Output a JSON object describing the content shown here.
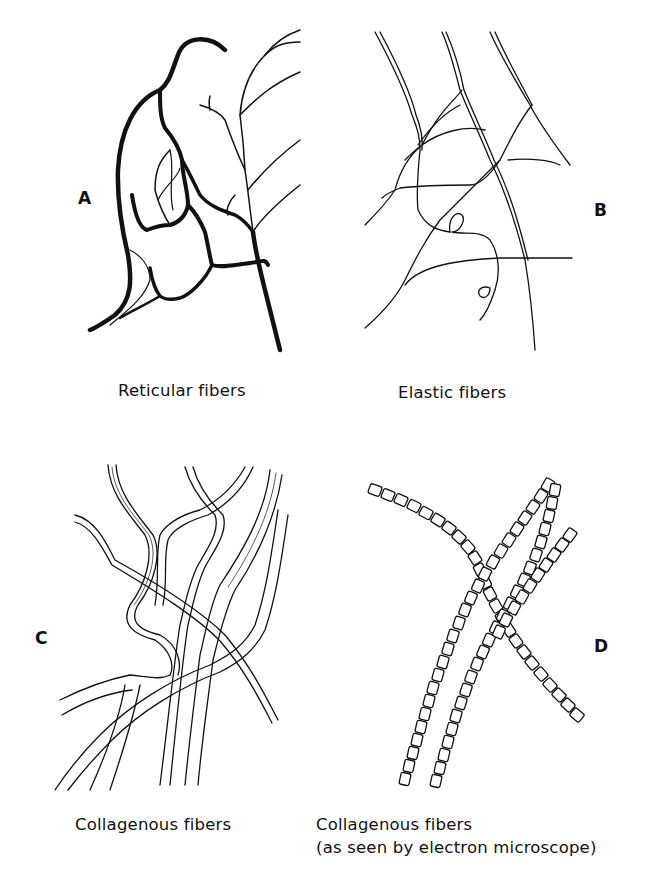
{
  "figure": {
    "panels": [
      {
        "letter": "A",
        "caption": "Reticular fibers"
      },
      {
        "letter": "B",
        "caption": "Elastic fibers"
      },
      {
        "letter": "C",
        "caption": "Collagenous fibers"
      },
      {
        "letter": "D",
        "caption_line1": "Collagenous fibers",
        "caption_line2": "(as seen by electron microscope)"
      }
    ]
  }
}
